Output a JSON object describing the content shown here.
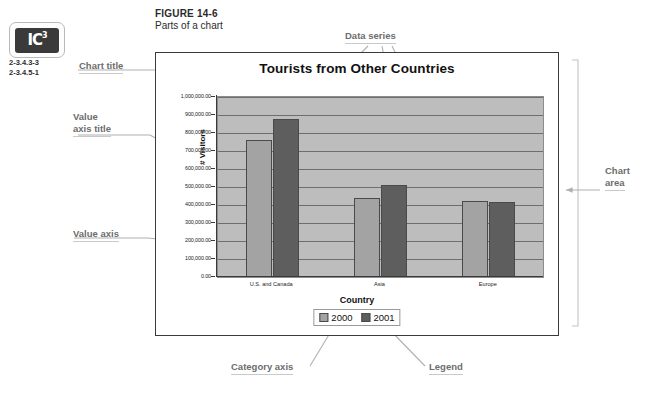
{
  "figure": {
    "number": "FIGURE 14-6",
    "subtitle": "Parts of a chart"
  },
  "logo": {
    "mark": "IC",
    "superscript": "3",
    "codes": [
      "2-3.4.3-3",
      "2-3.4.5-1"
    ]
  },
  "annotations": {
    "chart_title": "Chart title",
    "value_axis_title": "Value\naxis title",
    "value_axis_title_line1": "Value",
    "value_axis_title_line2": "axis title",
    "value_axis": "Value axis",
    "data_series": "Data series",
    "plot_area": "Plot area",
    "chart_area_line1": "Chart",
    "chart_area_line2": "area",
    "category_axis_title_line1": "Category",
    "category_axis_title_line2": "axis title",
    "category_axis": "Category axis",
    "legend": "Legend"
  },
  "colors": {
    "plot_background": "#bdbdbd",
    "gridline": "#6e6e6e",
    "series_2000": "#a3a3a3",
    "series_2001": "#5e5e5e",
    "axis": "#3a3a3a",
    "annotation_text": "#6d6d6d"
  },
  "chart_data": {
    "type": "bar",
    "title": "Tourists from Other Countries",
    "xlabel": "Country",
    "ylabel": "# Visitors",
    "categories": [
      "U.S. and Canada",
      "Asia",
      "Europe"
    ],
    "series": [
      {
        "name": "2000",
        "color": "#a3a3a3",
        "values": [
          760000,
          440000,
          425000
        ]
      },
      {
        "name": "2001",
        "color": "#5e5e5e",
        "values": [
          880000,
          510000,
          415000
        ]
      }
    ],
    "ylim": [
      0,
      1000000
    ],
    "ytick_step": 100000,
    "ytick_labels": [
      "0.00",
      "100,000.00",
      "200,000.00",
      "300,000.00",
      "400,000.00",
      "500,000.00",
      "600,000.00",
      "700,000.00",
      "800,000.00",
      "900,000.00",
      "1,000,000.00"
    ],
    "grid": true,
    "legend_position": "bottom"
  }
}
